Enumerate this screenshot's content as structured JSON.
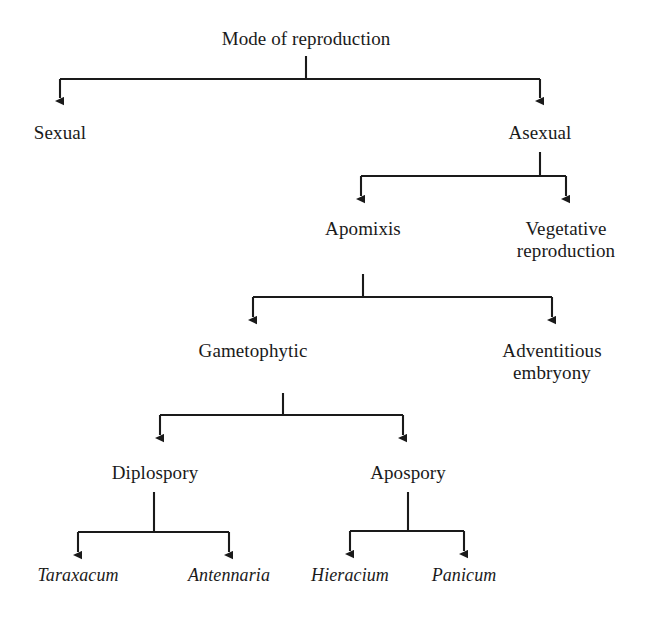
{
  "diagram": {
    "type": "tree-flowchart",
    "title": "Mode of reproduction",
    "orientation": "top-down",
    "line_color": "#1a1a1a",
    "text_color": "#1a1a1a",
    "background_color": "#ffffff",
    "arrow_style": "solid-triangle-down",
    "nodes": {
      "root": "Mode of reproduction",
      "sexual": "Sexual",
      "asexual": "Asexual",
      "apomixis": "Apomixis",
      "vegetative_reproduction": "Vegetative\nreproduction",
      "gametophytic": "Gametophytic",
      "adventitious_embryony": "Adventitious\nembryony",
      "diplospory": "Diplospory",
      "apospory": "Apospory",
      "taraxacum": "Taraxacum",
      "antennaria": "Antennaria",
      "hieracium": "Hieracium",
      "panicum": "Panicum"
    },
    "edges": [
      {
        "from": "root",
        "to": "sexual"
      },
      {
        "from": "root",
        "to": "asexual"
      },
      {
        "from": "asexual",
        "to": "apomixis"
      },
      {
        "from": "asexual",
        "to": "vegetative_reproduction"
      },
      {
        "from": "apomixis",
        "to": "gametophytic"
      },
      {
        "from": "apomixis",
        "to": "adventitious_embryony"
      },
      {
        "from": "gametophytic",
        "to": "diplospory"
      },
      {
        "from": "gametophytic",
        "to": "apospory"
      },
      {
        "from": "diplospory",
        "to": "taraxacum"
      },
      {
        "from": "diplospory",
        "to": "antennaria"
      },
      {
        "from": "apospory",
        "to": "hieracium"
      },
      {
        "from": "apospory",
        "to": "panicum"
      }
    ]
  }
}
